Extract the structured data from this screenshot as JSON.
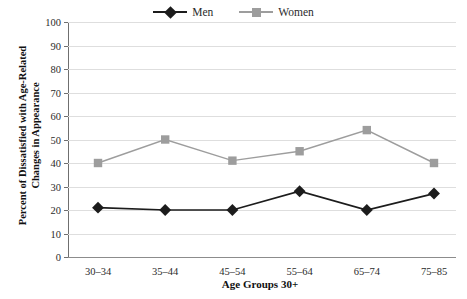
{
  "chart_data": {
    "type": "line",
    "title": "",
    "xlabel": "Age Groups 30+",
    "ylabel": "Percent of Dissatisfied with Age-Related Changes in Appearance",
    "ylabel_line1": "Percent of Dissatisfied with Age-Related",
    "ylabel_line2": "Changes in Appearance",
    "categories": [
      "30–34",
      "35–44",
      "45–54",
      "55–64",
      "65–74",
      "75–85"
    ],
    "series": [
      {
        "name": "Men",
        "values": [
          21,
          20,
          20,
          28,
          20,
          27
        ],
        "color": "#1c1c1c",
        "marker": "diamond"
      },
      {
        "name": "Women",
        "values": [
          40,
          50,
          41,
          45,
          54,
          40
        ],
        "color": "#9d9d9d",
        "marker": "square"
      }
    ],
    "ylim": [
      0,
      100
    ],
    "yticks": [
      0,
      10,
      20,
      30,
      40,
      50,
      60,
      70,
      80,
      90,
      100
    ],
    "ytick_labels": [
      "0",
      "10",
      "20",
      "30",
      "40",
      "50",
      "60",
      "70",
      "80",
      "90",
      "100"
    ],
    "grid": true,
    "grid_axis": "y",
    "legend_position": "top-center",
    "legend_entries": [
      "Men",
      "Women"
    ]
  },
  "colors": {
    "men_line": "#1c1c1c",
    "women_line": "#9d9d9d",
    "gridline": "#dedede",
    "axis": "#6f6f6f",
    "text": "#2b2b2b",
    "background": "#ffffff"
  }
}
